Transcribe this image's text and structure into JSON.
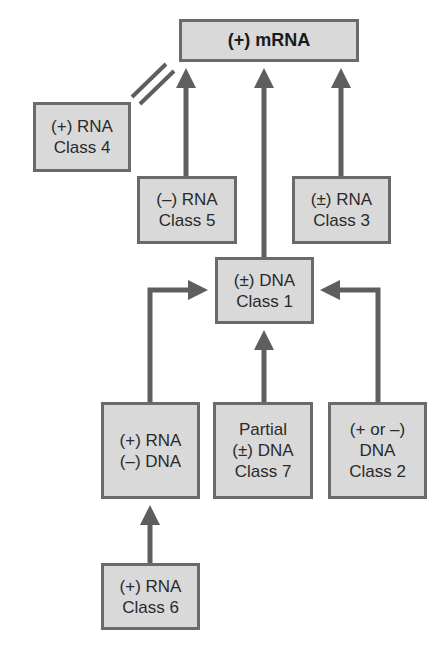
{
  "diagram": {
    "type": "flow-diagram",
    "colors": {
      "box_fill": "#d9d9d9",
      "box_border": "#6a6a6a",
      "arrow": "#5e5e5e",
      "text": "#2a2a2a"
    },
    "nodes": {
      "mrna": {
        "lines": [
          "(+) mRNA"
        ]
      },
      "class4": {
        "lines": [
          "(+) RNA",
          "Class 4"
        ]
      },
      "class5": {
        "lines": [
          "(–) RNA",
          "Class 5"
        ]
      },
      "class3": {
        "lines": [
          "(±) RNA",
          "Class 3"
        ]
      },
      "class1": {
        "lines": [
          "(±) DNA",
          "Class 1"
        ]
      },
      "rt": {
        "lines": [
          "(+) RNA",
          "(–) DNA"
        ]
      },
      "class7": {
        "lines": [
          "Partial",
          "(±) DNA",
          "Class 7"
        ]
      },
      "class2": {
        "lines": [
          "(+ or –)",
          "DNA",
          "Class 2"
        ]
      },
      "class6": {
        "lines": [
          "(+) RNA",
          "Class 6"
        ]
      }
    },
    "edges": [
      {
        "from": "class4",
        "to": "mrna",
        "style": "identity (double slash)"
      },
      {
        "from": "class5",
        "to": "mrna"
      },
      {
        "from": "class1",
        "to": "mrna"
      },
      {
        "from": "class3",
        "to": "mrna"
      },
      {
        "from": "rt",
        "to": "class1"
      },
      {
        "from": "class7",
        "to": "class1"
      },
      {
        "from": "class2",
        "to": "class1"
      },
      {
        "from": "class6",
        "to": "rt"
      }
    ]
  }
}
